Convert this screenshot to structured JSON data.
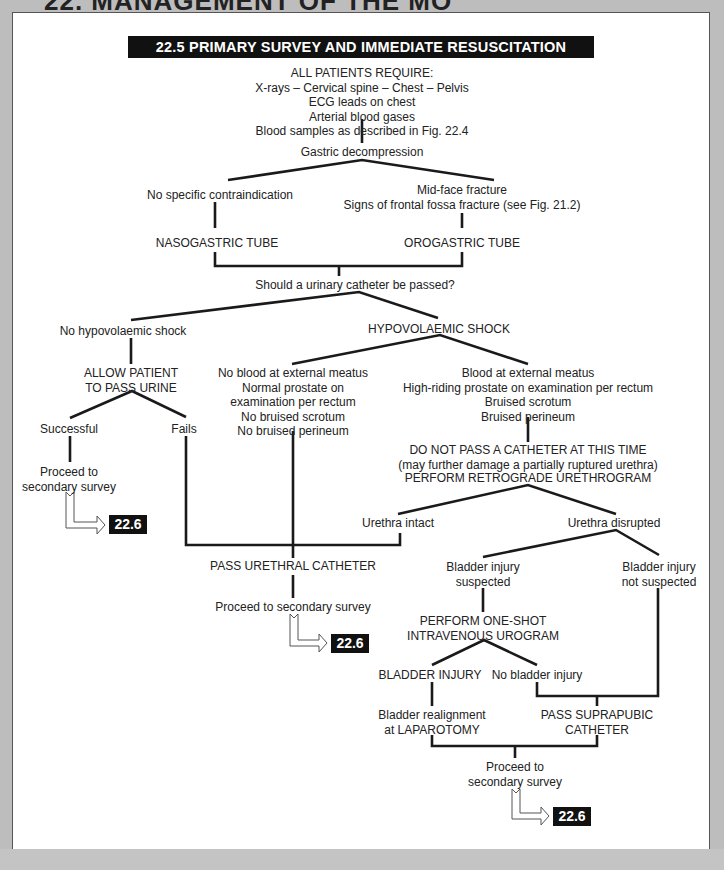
{
  "header": {
    "title": "22. MANAGEMENT OF THE MO"
  },
  "diagram": {
    "title": "22.5 PRIMARY SURVEY AND IMMEDIATE RESUSCITATION COMPLETE",
    "all_patients": [
      "ALL PATIENTS REQUIRE:",
      "X-rays – Cervical spine – Chest – Pelvis",
      "ECG leads on chest",
      "Arterial blood gases",
      "Blood samples as described in Fig. 22.4"
    ],
    "gastric": "Gastric decompression",
    "no_contra": "No specific contraindication",
    "midface": [
      "Mid-face fracture",
      "Signs of frontal fossa fracture (see Fig. 21.2)"
    ],
    "nasogastric": "NASOGASTRIC TUBE",
    "orogastric": "OROGASTRIC TUBE",
    "urinary_q": "Should a urinary catheter be passed?",
    "no_shock": "No hypovolaemic shock",
    "shock": "HYPOVOLAEMIC SHOCK",
    "allow_urine": [
      "ALLOW PATIENT",
      "TO PASS URINE"
    ],
    "successful": "Successful",
    "fails": "Fails",
    "proceed_1": [
      "Proceed to",
      "secondary survey"
    ],
    "no_blood": [
      "No blood at external meatus",
      "Normal prostate on",
      "examination per rectum",
      "No bruised scrotum",
      "No bruised perineum"
    ],
    "blood": [
      "Blood at external meatus",
      "High-riding prostate on examination per rectum",
      "Bruised scrotum",
      "Bruised perineum"
    ],
    "do_not_pass": [
      "DO NOT PASS A CATHETER AT THIS TIME",
      "(may further damage a partially ruptured urethra)"
    ],
    "retrograde": "PERFORM RETROGRADE URETHROGRAM",
    "intact": "Urethra intact",
    "disrupted": "Urethra disrupted",
    "pass_urethral": "PASS URETHRAL CATHETER",
    "proceed_2": "Proceed to secondary survey",
    "bladder_susp": [
      "Bladder injury",
      "suspected"
    ],
    "bladder_not_susp": [
      "Bladder injury",
      "not suspected"
    ],
    "ivu": [
      "PERFORM ONE-SHOT",
      "INTRAVENOUS UROGRAM"
    ],
    "bladder_injury": "BLADDER INJURY",
    "no_bladder_injury": "No bladder injury",
    "realign": [
      "Bladder realignment",
      "at LAPAROTOMY"
    ],
    "suprapubic": [
      "PASS SUPRAPUBIC",
      "CATHETER"
    ],
    "proceed_3": [
      "Proceed to",
      "secondary survey"
    ],
    "ref_label": "22.6"
  }
}
